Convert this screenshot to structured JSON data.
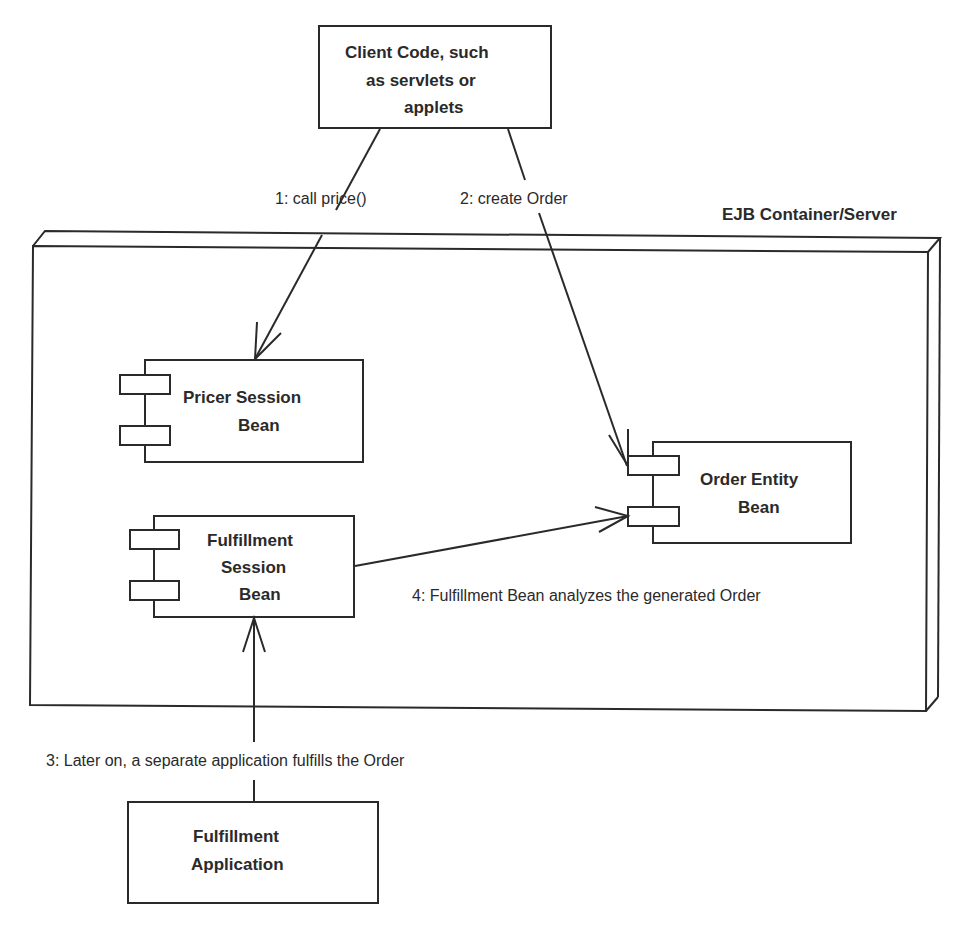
{
  "diagram": {
    "container": {
      "title": "EJB Container/Server"
    },
    "nodes": {
      "client": {
        "lines": [
          "Client Code, such",
          "as servlets or",
          "applets"
        ]
      },
      "pricer": {
        "lines": [
          "Pricer Session",
          "Bean"
        ]
      },
      "order": {
        "lines": [
          "Order Entity",
          "Bean"
        ]
      },
      "fulfillment_bean": {
        "lines": [
          "Fulfillment",
          "Session",
          "Bean"
        ]
      },
      "fulfillment_app": {
        "lines": [
          "Fulfillment",
          "Application"
        ]
      }
    },
    "messages": {
      "m1": "1: call price()",
      "m2": "2: create Order",
      "m3": "3: Later on, a separate application fulfills the Order",
      "m4": "4: Fulfillment Bean analyzes the generated Order"
    }
  }
}
